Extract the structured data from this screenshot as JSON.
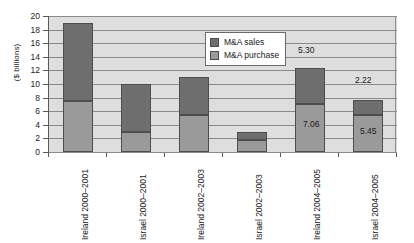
{
  "chart_data": {
    "type": "bar",
    "subtype": "stacked-column",
    "title": "",
    "xlabel": "",
    "ylabel": "($ billions)",
    "ylim": [
      0,
      20
    ],
    "ytick_step": 2,
    "ytick_labels": [
      "20",
      "18",
      "16",
      "14",
      "12",
      "10",
      "8",
      "6",
      "4",
      "2",
      "0"
    ],
    "grid": true,
    "legend_position": "inside-top-center",
    "categories": [
      "Ireland 2000–2001",
      "Israel 2000–2001",
      "Ireland 2002–2003",
      "Israel 2002–2003",
      "Ireland 2004–2005",
      "Israel 2004–2005"
    ],
    "series": [
      {
        "name": "M&A purchase",
        "color": "#9a9a9a",
        "values": [
          7.5,
          3.0,
          5.5,
          1.8,
          7.06,
          5.45
        ]
      },
      {
        "name": "M&A sales",
        "color": "#6e6e6e",
        "values": [
          11.5,
          7.0,
          5.5,
          1.1,
          5.3,
          2.22
        ]
      }
    ],
    "totals": [
      19.0,
      10.0,
      11.0,
      2.9,
      12.36,
      7.67
    ],
    "annotations": [
      {
        "text": "5.30",
        "category": "Ireland 2004–2005",
        "series": "M&A sales"
      },
      {
        "text": "7.06",
        "category": "Ireland 2004–2005",
        "series": "M&A purchase"
      },
      {
        "text": "2.22",
        "category": "Israel 2004–2005",
        "series": "M&A sales"
      },
      {
        "text": "5.45",
        "category": "Israel 2004–2005",
        "series": "M&A purchase"
      }
    ]
  },
  "axis": {
    "y_title": "($ billions)",
    "y_ticks": [
      "20",
      "18",
      "16",
      "14",
      "12",
      "10",
      "8",
      "6",
      "4",
      "2",
      "0"
    ]
  },
  "legend": {
    "items": [
      {
        "label": "M&A sales",
        "color": "#6e6e6e"
      },
      {
        "label": "M&A purchase",
        "color": "#9a9a9a"
      }
    ]
  },
  "labels": {
    "value_5_30": "5.30",
    "value_7_06": "7.06",
    "value_2_22": "2.22",
    "value_5_45": "5.45"
  },
  "colors": {
    "sales": "#6e6e6e",
    "purchase": "#9a9a9a",
    "plot_background": "#dedede",
    "gridline": "#8a8a8a",
    "axis": "#5a5a5a",
    "page_background": "#ffffff"
  }
}
